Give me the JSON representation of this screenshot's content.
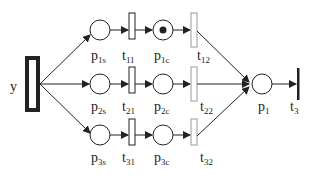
{
  "diagram": {
    "type": "petri-net",
    "source_transition": {
      "label": "y"
    },
    "branches": [
      {
        "start_place": {
          "base": "p",
          "sub": "1s"
        },
        "t_first": {
          "base": "t",
          "sub": "11"
        },
        "cont_place": {
          "base": "p",
          "sub": "1c",
          "tokens": 1
        },
        "t_second": {
          "base": "t",
          "sub": "12"
        }
      },
      {
        "start_place": {
          "base": "p",
          "sub": "2s"
        },
        "t_first": {
          "base": "t",
          "sub": "21"
        },
        "cont_place": {
          "base": "p",
          "sub": "2c",
          "tokens": 0
        },
        "t_second": {
          "base": "t",
          "sub": "22"
        }
      },
      {
        "start_place": {
          "base": "p",
          "sub": "3s"
        },
        "t_first": {
          "base": "t",
          "sub": "31"
        },
        "cont_place": {
          "base": "p",
          "sub": "3c",
          "tokens": 0
        },
        "t_second": {
          "base": "t",
          "sub": "32"
        }
      }
    ],
    "merge_place": {
      "base": "p",
      "sub": "1"
    },
    "sink_transition": {
      "base": "t",
      "sub": "3"
    },
    "colors": {
      "stroke": "#222222",
      "light_transition_stroke": "#999999",
      "background": "#ffffff"
    }
  }
}
